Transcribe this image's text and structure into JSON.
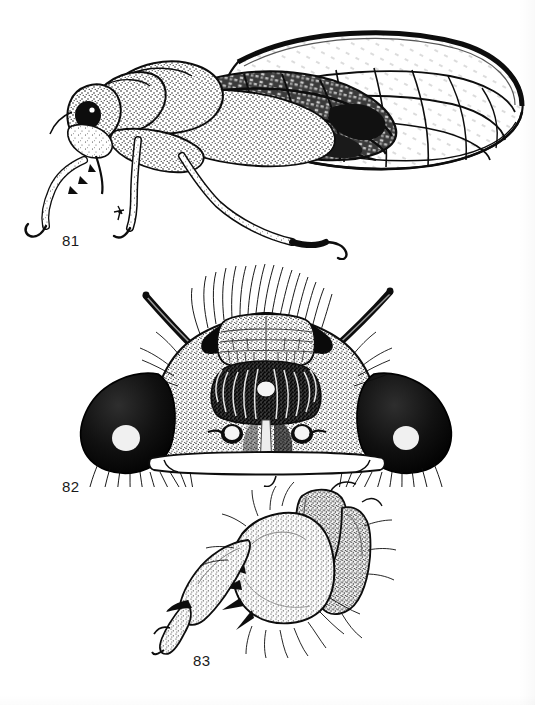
{
  "plate": {
    "type": "scientific-illustration-plate",
    "medium": "pen-and-ink stipple drawing",
    "background_color": "#ffffff",
    "ink_color": "#0d0d0d",
    "subject": "cicada (Hemiptera: Cicadidae)",
    "width_px": 535,
    "height_px": 705
  },
  "figures": [
    {
      "label": "81",
      "label_x": 62,
      "label_y": 232,
      "caption_view": "lateral habitus of adult cicada, left side view, head to left, forewing and hindwing spread to right",
      "features": [
        "head with large compound eye",
        "antenna (short seta-like)",
        "rostrum / beak directed ventrally",
        "pronotum and mesonotum stippled",
        "opaque basal membrane of forewing",
        "hyaline apical cells of forewing with dark veins",
        "foreleg with enlarged femur",
        "mid leg",
        "hind leg with tarsal claw"
      ]
    },
    {
      "label": "82",
      "label_x": 62,
      "label_y": 478,
      "caption_view": "head in frontal (anterior) view showing compound eyes, three ocelli, postclypeus and supra-antennal plates",
      "features": [
        "left compound eye (dark, with pale highlight)",
        "right compound eye (dark, with pale highlight)",
        "median ocellus (upper)",
        "left lateral ocellus",
        "right lateral ocellus",
        "postclypeus with transverse grooves",
        "vertex bearing dense long setae",
        "left antenna (elongate, dark)",
        "right antenna (elongate, dark)",
        "fringe of long setae along ventral margin"
      ],
      "ocelli_count": 3,
      "compound_eyes_count": 2
    },
    {
      "label": "83",
      "label_x": 193,
      "label_y": 652,
      "caption_view": "foreleg detail, lateral view: coxa, enlarged femur with ventral spines, tibia and tarsus with claw",
      "features": [
        "coxa",
        "swollen stippled femur",
        "primary femoral spine",
        "secondary femoral spines",
        "tibia",
        "tarsus with apical claw",
        "scattered long setae"
      ]
    }
  ],
  "labels_text": {
    "fig81": "81",
    "fig82": "82",
    "fig83": "83"
  }
}
